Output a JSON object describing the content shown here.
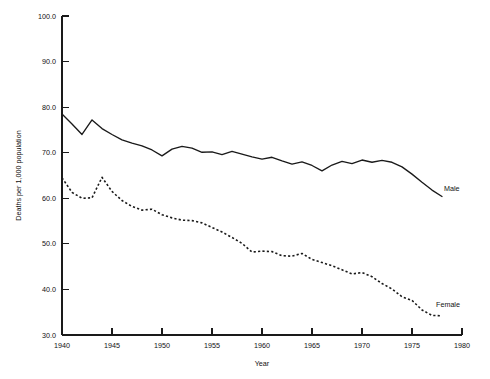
{
  "chart_data": {
    "type": "line",
    "title": "",
    "xlabel": "Year",
    "ylabel": "Deaths per 1,000 population",
    "xlim": [
      1940,
      1980
    ],
    "ylim": [
      30.0,
      100.0
    ],
    "grid": false,
    "legend_position": "inline-right-of-series-end",
    "x_ticks": [
      1940,
      1945,
      1950,
      1955,
      1960,
      1965,
      1970,
      1975,
      1980
    ],
    "x_tick_labels": [
      "1940",
      "1945",
      "1950",
      "1955",
      "1960",
      "1965",
      "1970",
      "1975",
      "1980"
    ],
    "y_ticks": [
      30.0,
      40.0,
      50.0,
      60.0,
      70.0,
      80.0,
      90.0,
      100.0
    ],
    "y_tick_labels": [
      "30.0",
      "40.0",
      "50.0",
      "60.0",
      "70.0",
      "80.0",
      "90.0",
      "100.0"
    ],
    "x": [
      1940,
      1941,
      1942,
      1943,
      1944,
      1945,
      1946,
      1947,
      1948,
      1949,
      1950,
      1951,
      1952,
      1953,
      1954,
      1955,
      1956,
      1957,
      1958,
      1959,
      1960,
      1961,
      1962,
      1963,
      1964,
      1965,
      1966,
      1967,
      1968,
      1969,
      1970,
      1971,
      1972,
      1973,
      1974,
      1975,
      1976,
      1977,
      1978
    ],
    "series": [
      {
        "name": "Male",
        "label": "Male",
        "style": "solid",
        "color": "#1a1a1a",
        "values": [
          78.5,
          76.3,
          74.0,
          77.2,
          75.3,
          74.0,
          72.8,
          72.1,
          71.5,
          70.6,
          69.3,
          70.8,
          71.4,
          71.0,
          70.1,
          70.2,
          69.6,
          70.3,
          69.7,
          69.1,
          68.6,
          69.0,
          68.2,
          67.5,
          68.0,
          67.2,
          66.0,
          67.3,
          68.1,
          67.6,
          68.4,
          67.9,
          68.3,
          67.9,
          66.9,
          65.3,
          63.5,
          61.8,
          60.4
        ]
      },
      {
        "name": "Female",
        "label": "Female",
        "style": "dashed",
        "color": "#1a1a1a",
        "values": [
          64.5,
          61.3,
          60.0,
          60.1,
          64.6,
          61.5,
          59.5,
          58.2,
          57.4,
          57.6,
          56.4,
          55.7,
          55.2,
          55.1,
          54.6,
          53.6,
          52.6,
          51.4,
          50.1,
          48.2,
          48.4,
          48.3,
          47.4,
          47.3,
          47.9,
          46.6,
          45.9,
          45.2,
          44.3,
          43.4,
          43.7,
          42.8,
          41.3,
          40.1,
          38.4,
          37.6,
          35.5,
          34.3,
          34.2
        ]
      }
    ],
    "annotations": [
      {
        "text": "Male",
        "x": 1978.2,
        "y": 61.6
      },
      {
        "text": "Female",
        "x": 1977.4,
        "y": 36.2
      }
    ]
  }
}
